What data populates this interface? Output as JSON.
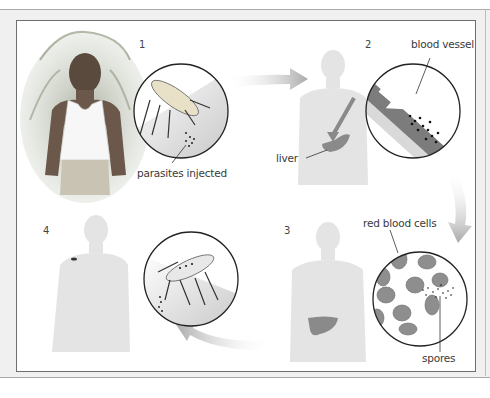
{
  "diagram": {
    "steps": [
      {
        "number": "1",
        "labels": [
          "parasites injected"
        ]
      },
      {
        "number": "2",
        "labels": [
          "blood vessel",
          "liver"
        ]
      },
      {
        "number": "3",
        "labels": [
          "red blood cells",
          "spores"
        ]
      },
      {
        "number": "4",
        "labels": []
      }
    ],
    "colors": {
      "frame": "#6e6e6e",
      "background": "#f0f0f0",
      "silhouette": "#e2e2e2",
      "arrow": "#b5b5b5",
      "liver": "#8a8a8a",
      "cell": "#8e8e8e"
    }
  }
}
